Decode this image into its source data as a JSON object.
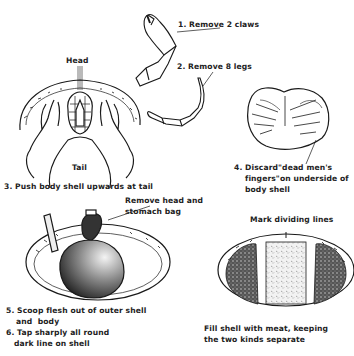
{
  "diagram": {
    "steps": {
      "step1": "1. Remove 2 claws",
      "step2": "2. Remove 8 legs",
      "head_label": "Head",
      "tail_label": "Tail",
      "step3": "3. Push body shell upwards at tail",
      "step4_line1": "4. Discard\"dead men's",
      "step4_line2": "fingers\"on underside of",
      "step4_line3": "body shell",
      "remove_head_line1": "Remove head and",
      "remove_head_line2": "stomach bag",
      "mark_lines": "Mark dividing lines",
      "step5_line1": "5. Scoop flesh out of outer shell",
      "step5_line2": "and  body",
      "step6_line1": "6. Tap sharply all round",
      "step6_line2": "dark line on shell",
      "fill_line1": "Fill shell with meat, keeping",
      "fill_line2": "the two kinds separate"
    },
    "colors": {
      "ink": "#1a1a1a",
      "paper": "#ffffff"
    }
  }
}
